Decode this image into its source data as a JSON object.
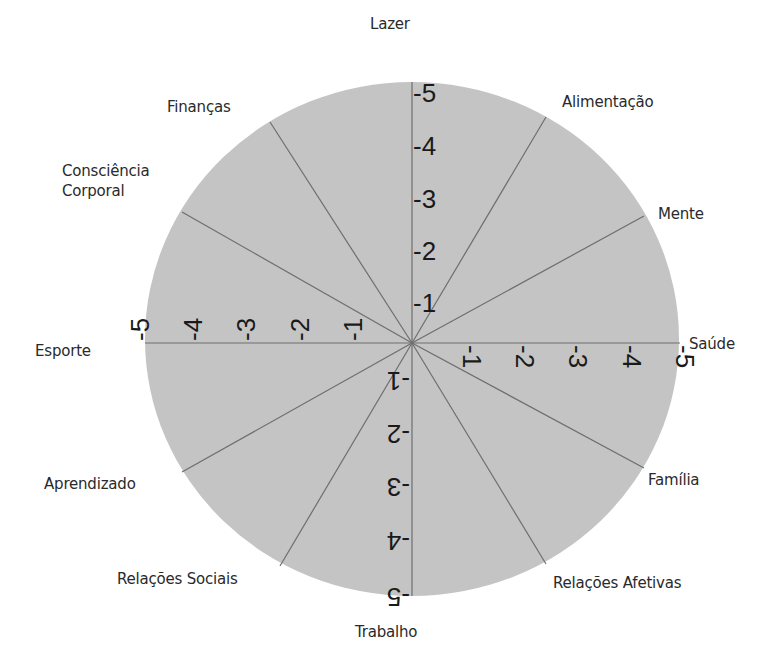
{
  "diagram": {
    "type": "wheel-of-life",
    "center": {
      "x": 412,
      "y": 343
    },
    "radius_x": 267,
    "radius_y": 260,
    "sectors": 12,
    "colors": {
      "fill": "#c4c4c4",
      "lines": "#6e6e6e",
      "text": "#2a2a2a",
      "background": "#ffffff"
    },
    "scale_ticks": [
      "-1",
      "-2",
      "-3",
      "-4",
      "-5"
    ],
    "areas": [
      {
        "label": "Lazer"
      },
      {
        "label": "Alimentação"
      },
      {
        "label": "Mente"
      },
      {
        "label": "Saúde"
      },
      {
        "label": "Família"
      },
      {
        "label": "Relações Afetivas"
      },
      {
        "label": "Trabalho"
      },
      {
        "label": "Relações Sociais"
      },
      {
        "label": "Aprendizado"
      },
      {
        "label": "Esporte"
      },
      {
        "label": "Consciência Corporal"
      },
      {
        "label": "Finanças"
      }
    ],
    "labels_multiline": {
      "consciencia_line1": "Consciência",
      "consciencia_line2": "Corporal"
    }
  }
}
